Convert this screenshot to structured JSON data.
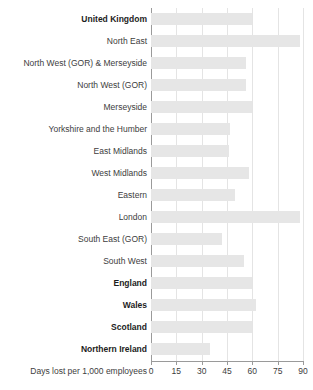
{
  "chart_data": {
    "type": "bar",
    "orientation": "horizontal",
    "title": "",
    "subtitle": "",
    "xlabel": "Days lost per 1,000 employees",
    "ylabel": "",
    "xlim": [
      0,
      90
    ],
    "xticks": [
      0,
      15,
      30,
      45,
      60,
      75,
      90
    ],
    "xtick_labels": [
      "0",
      "15",
      "30",
      "45",
      "60",
      "75",
      "90"
    ],
    "grid": true,
    "grid_axis": "x",
    "legend": false,
    "bar_color": "#e6e6e6",
    "axis_color": "#9a9a9a",
    "gridline_color": "#e4e4e4",
    "categories": [
      "United Kingdom",
      "North East",
      "North West (GOR) & Merseyside",
      "North West (GOR)",
      "Merseyside",
      "Yorkshire and the Humber",
      "East Midlands",
      "West Midlands",
      "Eastern",
      "London",
      "South East (GOR)",
      "South West",
      "England",
      "Wales",
      "Scotland",
      "Northern Ireland"
    ],
    "values": [
      60,
      88,
      56,
      56,
      60,
      47,
      46,
      58,
      50,
      88,
      42,
      55,
      60,
      62,
      60,
      35
    ],
    "emphasis": [
      true,
      false,
      false,
      false,
      false,
      false,
      false,
      false,
      false,
      false,
      false,
      false,
      true,
      true,
      true,
      true
    ]
  }
}
